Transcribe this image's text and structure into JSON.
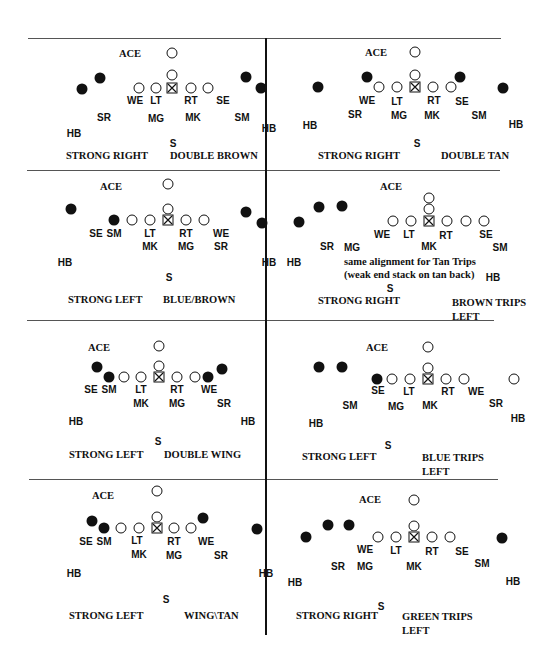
{
  "panels": [
    {
      "id": "p1",
      "ace_label": "ACE",
      "strength": "STRONG RIGHT",
      "formation": "DOUBLE BROWN",
      "labels": {
        "we": "WE",
        "lt": "LT",
        "rt": "RT",
        "se": "SE",
        "sr": "SR",
        "mg": "MG",
        "mk": "MK",
        "sm": "SM",
        "hb_l": "HB",
        "hb_r": "HB",
        "s": "S"
      }
    },
    {
      "id": "p2",
      "ace_label": "ACE",
      "strength": "STRONG RIGHT",
      "formation": "DOUBLE TAN",
      "labels": {
        "we": "WE",
        "lt": "LT",
        "rt": "RT",
        "se": "SE",
        "sr": "SR",
        "mg": "MG",
        "mk": "MK",
        "sm": "SM",
        "hb_l": "HB",
        "hb_r": "HB",
        "s": "S"
      }
    },
    {
      "id": "p3",
      "ace_label": "ACE",
      "strength": "STRONG LEFT",
      "formation": "BLUE/BROWN",
      "labels": {
        "se": "SE",
        "sm": "SM",
        "lt": "LT",
        "mk": "MK",
        "rt": "RT",
        "mg": "MG",
        "we": "WE",
        "sr": "SR",
        "hb_l": "HB",
        "hb_r": "HB",
        "s": "S"
      }
    },
    {
      "id": "p4",
      "ace_label": "ACE",
      "strength": "STRONG RIGHT",
      "formation_line1": "BROWN TRIPS",
      "formation_line2": "LEFT",
      "note_line1": "same alignment for Tan Trips",
      "note_line2": "(weak end stack on tan back)",
      "labels": {
        "we": "WE",
        "lt": "LT",
        "rt": "RT",
        "se": "SE",
        "sr": "SR",
        "mg": "MG",
        "mk": "MK",
        "sm": "SM",
        "hb_l": "HB",
        "hb_r": "HB",
        "s": "S"
      }
    },
    {
      "id": "p5",
      "ace_label": "ACE",
      "strength": "STRONG LEFT",
      "formation": "DOUBLE WING",
      "labels": {
        "se": "SE",
        "sm": "SM",
        "lt": "LT",
        "mk": "MK",
        "rt": "RT",
        "mg": "MG",
        "we": "WE",
        "sr": "SR",
        "hb_l": "HB",
        "hb_r": "HB",
        "s": "S"
      }
    },
    {
      "id": "p6",
      "ace_label": "ACE",
      "strength": "STRONG LEFT",
      "formation_line1": "BLUE TRIPS",
      "formation_line2": "LEFT",
      "labels": {
        "se": "SE",
        "lt": "LT",
        "rt": "RT",
        "we": "WE",
        "sm": "SM",
        "mg": "MG",
        "mk": "MK",
        "sr": "SR",
        "hb_l": "HB",
        "hb_r": "HB",
        "s": "S"
      }
    },
    {
      "id": "p7",
      "ace_label": "ACE",
      "strength": "STRONG LEFT",
      "formation": "WING\\TAN",
      "labels": {
        "se": "SE",
        "sm": "SM",
        "lt": "LT",
        "mk": "MK",
        "rt": "RT",
        "mg": "MG",
        "we": "WE",
        "sr": "SR",
        "hb_l": "HB",
        "hb_r": "HB",
        "s": "S"
      }
    },
    {
      "id": "p8",
      "ace_label": "ACE",
      "strength": "STRONG RIGHT",
      "formation_line1": "GREEN TRIPS",
      "formation_line2": "LEFT",
      "labels": {
        "we": "WE",
        "lt": "LT",
        "rt": "RT",
        "se": "SE",
        "sr": "SR",
        "mg": "MG",
        "mk": "MK",
        "sm": "SM",
        "hb_l": "HB",
        "hb_r": "HB",
        "s": "S"
      }
    }
  ],
  "legend_symbols": {
    "open_circle": "offensive player",
    "filled_circle": "receiver / back",
    "boxed_x": "center"
  }
}
